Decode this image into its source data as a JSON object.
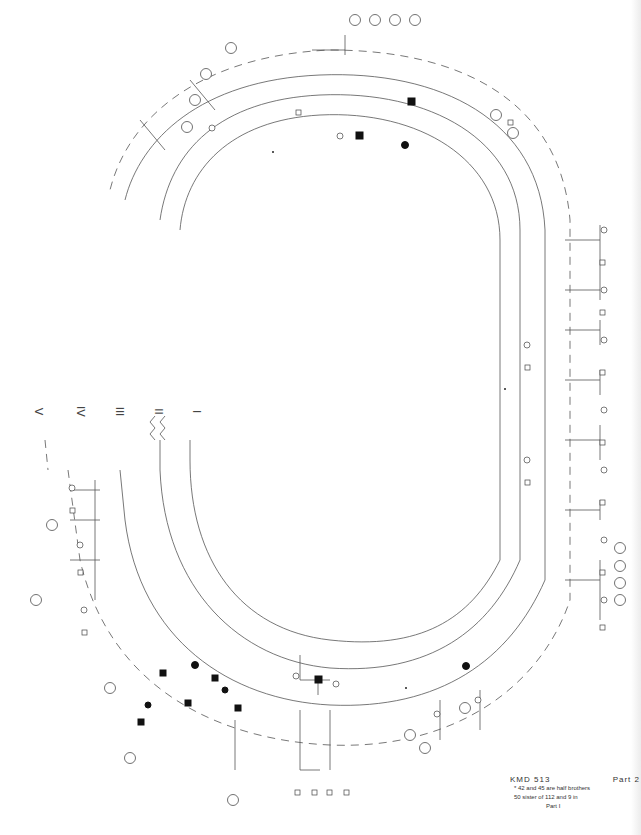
{
  "document": {
    "kind": "pedigree-chart",
    "orientation": "rotated-90"
  },
  "legend": {
    "id": "KMD 513",
    "part": "Part 2",
    "notes": [
      "* 42 and 45 are half brothers",
      "50 sister of 112 and 9 in",
      "Part I"
    ]
  },
  "generation_labels": [
    "V",
    "IV",
    "III",
    "II",
    "I"
  ],
  "colors": {
    "line": "#444444",
    "affected_fill": "#111111",
    "background": "#ffffff"
  },
  "founders": {
    "ids": [
      "2",
      "4",
      "6"
    ],
    "affected": [
      "4"
    ]
  },
  "generation_II": {
    "ids": [
      "42",
      "43",
      "45",
      "47",
      "49",
      "50",
      "51",
      "52",
      "53",
      "54",
      "55",
      "56",
      "57",
      "58",
      "59",
      "60",
      "61",
      "62",
      "63",
      "64",
      "65",
      "66",
      "67"
    ],
    "affected": [
      "47",
      "58",
      "59",
      "53"
    ]
  },
  "top_arc_labels": [
    "318",
    "302",
    "311",
    "310",
    "315",
    "314",
    "309",
    "175",
    "176",
    "177",
    "178",
    "179",
    "180",
    "171",
    "150",
    "151",
    "155",
    "156",
    "157",
    "158",
    "159",
    "160",
    "161",
    "162"
  ],
  "right_side_labels": [
    "201",
    "202",
    "203",
    "204",
    "205",
    "206",
    "207",
    "208",
    "209",
    "210",
    "281",
    "282",
    "283",
    "284",
    "285",
    "286",
    "287",
    "288",
    "289",
    "290",
    "291",
    "292",
    "293",
    "294",
    "295",
    "296",
    "408",
    "409",
    "410",
    "411",
    "412",
    "413",
    "414",
    "415",
    "416",
    "417",
    "418",
    "419",
    "420",
    "421",
    "422",
    "423",
    "424",
    "425",
    "426",
    "427",
    "428",
    "429",
    "430",
    "431",
    "432"
  ],
  "bottom_right_labels": [
    "43",
    "44",
    "45",
    "46",
    "47",
    "48",
    "49",
    "50",
    "141",
    "142",
    "143",
    "144",
    "145",
    "146",
    "147",
    "148",
    "149",
    "270",
    "271",
    "272",
    "273",
    "274",
    "275",
    "276",
    "277",
    "278",
    "279",
    "280"
  ],
  "bottom_labels": [
    "2",
    "4",
    "6",
    "39",
    "40",
    "41",
    "130",
    "131",
    "132",
    "133",
    "134",
    "135",
    "136",
    "137",
    "138",
    "139",
    "140",
    "141",
    "142",
    "143",
    "264",
    "265",
    "266",
    "267",
    "268",
    "269"
  ],
  "left_side_labels": [
    "36",
    "37",
    "118",
    "119",
    "120",
    "121",
    "122",
    "123",
    "124",
    "125",
    "126",
    "127",
    "128",
    "129",
    "248",
    "249",
    "250",
    "251",
    "252",
    "253",
    "254",
    "255",
    "256",
    "257",
    "258",
    "259",
    "260",
    "261",
    "262",
    "263",
    "395",
    "396",
    "397",
    "398",
    "399",
    "400",
    "401",
    "402",
    "403",
    "404",
    "405",
    "406",
    "407",
    "408"
  ],
  "circled_counts_sample": [
    "8",
    "4",
    "3",
    "2",
    "6",
    "9",
    "5",
    "7"
  ]
}
